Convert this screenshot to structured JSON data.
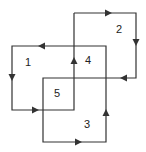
{
  "diagram": {
    "stroke_color": "#333333",
    "regions": [
      {
        "label": "1",
        "x": 28,
        "y": 62
      },
      {
        "label": "2",
        "x": 119,
        "y": 29
      },
      {
        "label": "4",
        "x": 88,
        "y": 60
      },
      {
        "label": "5",
        "x": 57,
        "y": 93
      },
      {
        "label": "3",
        "x": 87,
        "y": 124
      }
    ],
    "path_points": [
      [
        74,
        13
      ],
      [
        136,
        13
      ],
      [
        136,
        78
      ],
      [
        43,
        78
      ],
      [
        43,
        142
      ],
      [
        106,
        142
      ],
      [
        106,
        46
      ],
      [
        12,
        46
      ],
      [
        12,
        110
      ],
      [
        74,
        110
      ],
      [
        74,
        13
      ]
    ],
    "arrows": [
      {
        "x": 108,
        "y": 13,
        "dir": "right"
      },
      {
        "x": 136,
        "y": 42,
        "dir": "down"
      },
      {
        "x": 124,
        "y": 78,
        "dir": "left"
      },
      {
        "x": 78,
        "y": 142,
        "dir": "right"
      },
      {
        "x": 106,
        "y": 113,
        "dir": "up"
      },
      {
        "x": 42,
        "y": 46,
        "dir": "left"
      },
      {
        "x": 12,
        "y": 77,
        "dir": "down"
      },
      {
        "x": 35,
        "y": 110,
        "dir": "right"
      },
      {
        "x": 74,
        "y": 61,
        "dir": "up"
      }
    ]
  }
}
